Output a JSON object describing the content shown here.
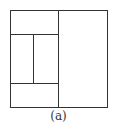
{
  "diagram": {
    "caption": "(a)",
    "line_color": "#333333",
    "outer_rect": {
      "x": 10,
      "y": 10,
      "w": 97,
      "h": 97
    },
    "partitions": [
      {
        "name": "right-panel",
        "x": 59,
        "y": 10,
        "w": 48,
        "h": 97
      },
      {
        "name": "top-left-panel",
        "x": 10,
        "y": 10,
        "w": 49,
        "h": 24
      },
      {
        "name": "middle-left-panel",
        "x": 10,
        "y": 34,
        "w": 24,
        "h": 49
      },
      {
        "name": "middle-center-panel",
        "x": 34,
        "y": 34,
        "w": 25,
        "h": 49
      },
      {
        "name": "bottom-left-panel",
        "x": 10,
        "y": 83,
        "w": 49,
        "h": 24
      }
    ]
  }
}
